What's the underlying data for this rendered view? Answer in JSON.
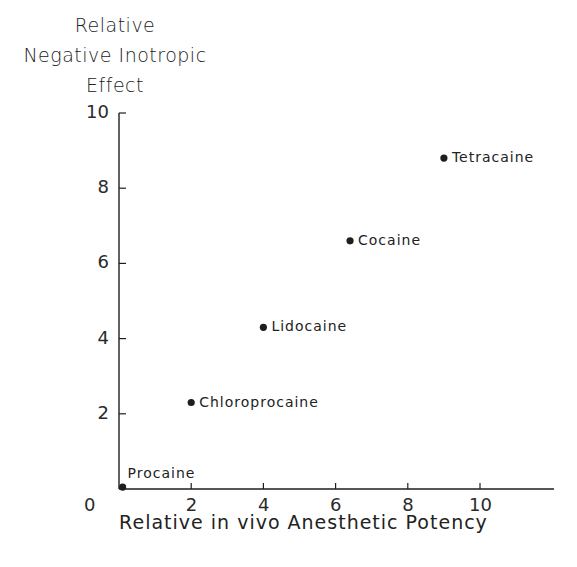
{
  "chart_data": {
    "type": "scatter",
    "title": "",
    "ylabel_lines": [
      "Relative",
      "Negative Inotropic",
      "Effect"
    ],
    "ylabel": "Relative Negative Inotropic Effect",
    "xlabel": "Relative in vivo Anesthetic Potency",
    "xlim": [
      0,
      12
    ],
    "ylim": [
      0,
      10
    ],
    "xticks": [
      0,
      2,
      4,
      6,
      8,
      10
    ],
    "yticks": [
      0,
      2,
      4,
      6,
      8,
      10
    ],
    "xtick_labels": [
      "0",
      "2",
      "4",
      "6",
      "8",
      "10"
    ],
    "ytick_labels": [
      "0",
      "2",
      "4",
      "6",
      "8",
      "10"
    ],
    "grid": false,
    "legend": null,
    "points": [
      {
        "label": "Procaine",
        "x": 0.1,
        "y": 0.05
      },
      {
        "label": "Chloroprocaine",
        "x": 2.0,
        "y": 2.3
      },
      {
        "label": "Lidocaine",
        "x": 4.0,
        "y": 4.3
      },
      {
        "label": "Cocaine",
        "x": 6.4,
        "y": 6.6
      },
      {
        "label": "Tetracaine",
        "x": 9.0,
        "y": 8.8
      }
    ],
    "colors": {
      "ink": "#1e1e1e",
      "background": "#ffffff"
    }
  }
}
